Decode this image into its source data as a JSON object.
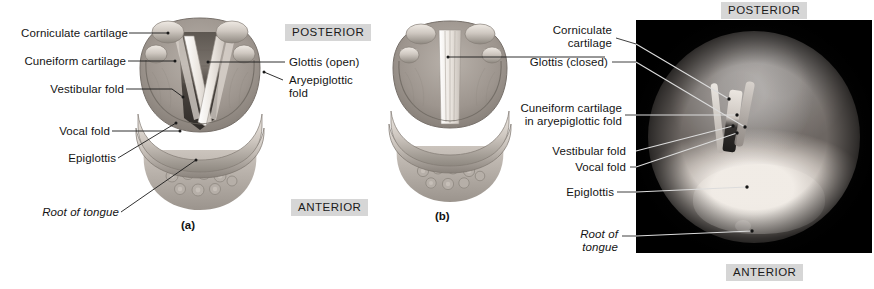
{
  "figure": {
    "panels": [
      {
        "id": "a",
        "caption": "(a)",
        "description": "Glottis open — illustration of the superior view of the larynx"
      },
      {
        "id": "b",
        "caption": "(b)",
        "description": "Glottis closed — illustration of the superior view of the larynx"
      },
      {
        "id": "c",
        "caption": "",
        "description": "Endoscopic photograph of the larynx through a laryngoscope"
      }
    ]
  },
  "orientation": {
    "posterior_left": "POSTERIOR",
    "anterior_left": "ANTERIOR",
    "posterior_right": "POSTERIOR",
    "anterior_right": "ANTERIOR"
  },
  "panel_a_labels": {
    "corniculate_cartilage": "Corniculate cartilage",
    "cuneiform_cartilage": "Cuneiform cartilage",
    "vestibular_fold": "Vestibular fold",
    "vocal_fold": "Vocal fold",
    "epiglottis": "Epiglottis",
    "root_of_tongue": "Root of tongue",
    "glottis_open": "Glottis (open)",
    "aryepiglottic_fold_line1": "Aryepiglottic",
    "aryepiglottic_fold_line2": "fold"
  },
  "panel_c_labels": {
    "corniculate_line1": "Corniculate",
    "corniculate_line2": "cartilage",
    "glottis_closed": "Glottis (closed)",
    "cuneiform_line1": "Cuneiform cartilage",
    "cuneiform_line2": "in aryepiglottic fold",
    "vestibular_fold": "Vestibular fold",
    "vocal_fold": "Vocal fold",
    "epiglottis": "Epiglottis",
    "root_of_tongue_line1": "Root of",
    "root_of_tongue_line2": "tongue"
  },
  "captions": {
    "a": "(a)",
    "b": "(b)"
  },
  "colors": {
    "chip_background": "#d6d6d6",
    "text": "#141414",
    "leader_dark": "#1a1a1a",
    "leader_light": "#d8d8d8",
    "photo_background": "#050505",
    "page_background": "#ffffff"
  }
}
